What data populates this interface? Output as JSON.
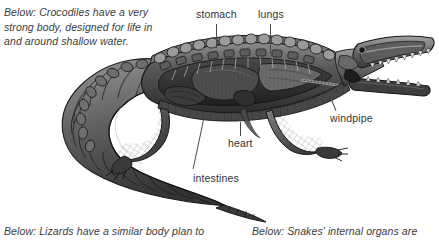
{
  "figure": {
    "style": "grayscale-illustration",
    "background_color": "#ffffff",
    "ink_color": "#333333"
  },
  "captions": {
    "top": "Below: Crocodiles have a very\nstrong body, designed for life in\nand around shallow water.",
    "bottom_left": "Below: Lizards have a similar body plan to",
    "bottom_right": "Below: Snakes' internal organs are"
  },
  "labels": {
    "stomach": "stomach",
    "lungs": "lungs",
    "windpipe": "windpipe",
    "heart": "heart",
    "intestines": "intestines"
  },
  "palette": {
    "scale_dark": "#2b2b2b",
    "scale_mid": "#5a5a5a",
    "scale_light": "#8d8d8d",
    "organ_dark": "#363636",
    "organ_mid": "#565656",
    "organ_light": "#7d7d7d",
    "outline": "#1e1e1e",
    "leader_line": "#4a4a4a"
  }
}
